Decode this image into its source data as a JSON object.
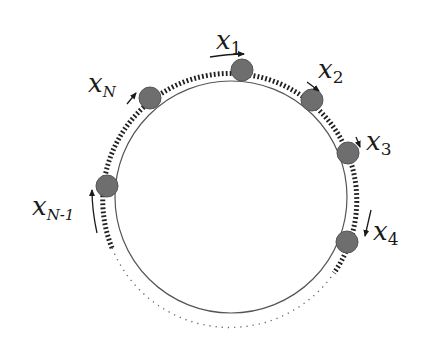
{
  "diagram": {
    "type": "ring-of-particles",
    "colors": {
      "ball": "#6e6e6e",
      "ball_edge": "#555555",
      "dash": "#2a2a2a",
      "circle": "#555555",
      "label": "#1a1a1a"
    },
    "particles": [
      {
        "id": "x1",
        "label": "x",
        "sub": "1"
      },
      {
        "id": "x2",
        "label": "x",
        "sub": "2"
      },
      {
        "id": "x3",
        "label": "x",
        "sub": "3"
      },
      {
        "id": "x4",
        "label": "x",
        "sub": "4"
      },
      {
        "id": "xN",
        "label": "x",
        "sub": "N"
      },
      {
        "id": "xN-1",
        "label": "x",
        "sub": "N-1"
      }
    ]
  }
}
